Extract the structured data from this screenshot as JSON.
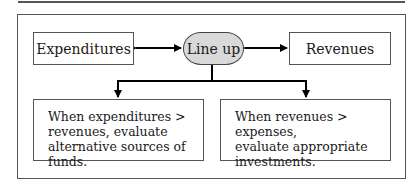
{
  "diagram": {
    "nodes": {
      "expenditures": "Expenditures",
      "center": "Line up",
      "revenues": "Revenues"
    },
    "outcomes": {
      "left": [
        "When expenditures >",
        "revenues, evaluate",
        "alternative sources of funds."
      ],
      "right": [
        "When revenues > expenses,",
        "evaluate appropriate",
        "investments."
      ]
    },
    "colors": {
      "ellipse_fill": "#d9d9d9",
      "line": "#000000",
      "border": "#555555"
    }
  }
}
